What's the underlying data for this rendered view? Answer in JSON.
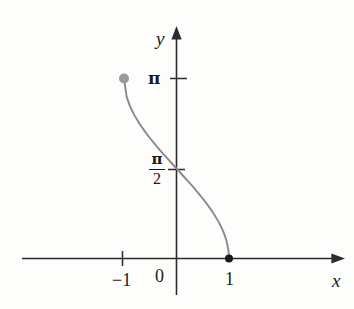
{
  "chart_data": {
    "type": "line",
    "title": "",
    "subtitle": "",
    "xlabel": "x",
    "ylabel": "y",
    "function": "y = arccos(x)",
    "xlim": [
      -1.45,
      1.55
    ],
    "ylim": [
      -0.35,
      3.55
    ],
    "grid": false,
    "legend": null,
    "x_ticks": [
      {
        "value": -1,
        "label": "−1"
      },
      {
        "value": 0,
        "label": "0"
      },
      {
        "value": 1,
        "label": "1"
      }
    ],
    "y_ticks": [
      {
        "value": 1.5707963,
        "label": "π/2",
        "numerator": "π",
        "denominator": "2"
      },
      {
        "value": 3.1415927,
        "label": "π"
      }
    ],
    "series": [
      {
        "name": "arccos",
        "color": "#8a8a8a",
        "x": [
          -1.0,
          -0.95,
          -0.9,
          -0.85,
          -0.8,
          -0.7,
          -0.6,
          -0.5,
          -0.4,
          -0.3,
          -0.2,
          -0.1,
          0.0,
          0.1,
          0.2,
          0.3,
          0.4,
          0.5,
          0.6,
          0.7,
          0.8,
          0.85,
          0.9,
          0.95,
          0.99,
          1.0
        ],
        "y": [
          3.1416,
          2.8244,
          2.6906,
          2.5874,
          2.4981,
          2.3462,
          2.2143,
          2.0944,
          1.9823,
          1.8755,
          1.7722,
          1.671,
          1.5708,
          1.4706,
          1.3694,
          1.2661,
          1.1593,
          1.0472,
          0.9273,
          0.7954,
          0.6435,
          0.5548,
          0.451,
          0.3176,
          0.1415,
          0.0
        ]
      }
    ],
    "markers": [
      {
        "name": "left-endpoint",
        "x": -1,
        "y": 3.1415927,
        "style": "filled-circle",
        "color": "#9a9a9a",
        "radius": 5
      },
      {
        "name": "right-endpoint",
        "x": 1,
        "y": 0,
        "style": "filled-circle",
        "color": "#1a1a1a",
        "radius": 4
      }
    ]
  },
  "axes": {
    "y_axis_label": "y",
    "x_axis_label": "x",
    "origin_label": "0"
  },
  "labels": {
    "pi": "π",
    "pi_over_two_numerator": "π",
    "pi_over_two_denominator": "2",
    "neg_one": "−1",
    "one": "1",
    "zero": "0"
  },
  "colors": {
    "axis": "#2b2b2b",
    "curve": "#8a8a8a",
    "text": "#1a1a1a",
    "background": "#fdfdfc",
    "left_endpoint": "#9a9a9a",
    "right_endpoint": "#1a1a1a"
  }
}
